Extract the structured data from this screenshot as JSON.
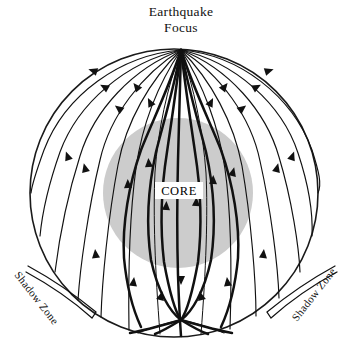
{
  "figure": {
    "kind": "seismic-ray-cross-section",
    "title": "Earthquake Focus",
    "title_line_1": "Earthquake",
    "title_line_2": "Focus",
    "core_label": "CORE",
    "shadow_zone_label_left": "Shadow Zone",
    "shadow_zone_label_right": "Shadow Zone"
  },
  "colors": {
    "background": "#ffffff",
    "ink": "#111111",
    "earth_outline": "#1a1a1a",
    "core_fill": "#cccccc",
    "label_box_fill": "#ffffff"
  },
  "geometry": {
    "earth": {
      "cx": 174,
      "cy": 193,
      "r": 144
    },
    "core": {
      "cx": 178,
      "cy": 193,
      "r": 75
    },
    "focus": {
      "x": 181,
      "y": 50
    },
    "bottom_convergence": {
      "x": 181,
      "y": 320
    }
  },
  "chart_data": {
    "type": "diagram",
    "title": "Earthquake Focus",
    "annotations": [
      "Earthquake Focus",
      "CORE",
      "Shadow Zone",
      "Shadow Zone"
    ],
    "elements": {
      "earth_circle": 1,
      "core_circle": 1,
      "mantle_rays": 14,
      "core_rays": 7,
      "shadow_zone_brackets": 2
    }
  }
}
